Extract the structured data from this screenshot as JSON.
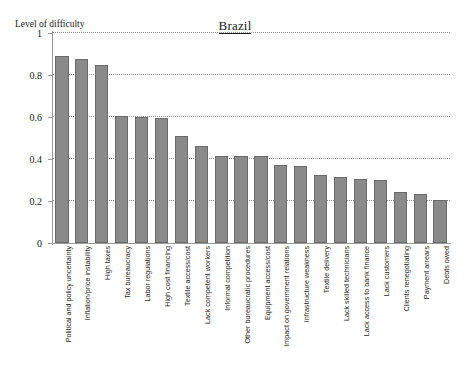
{
  "chart_data": {
    "type": "bar",
    "title": "Brazil",
    "xlabel": "",
    "ylabel": "Level of difficulty",
    "ylim": [
      0,
      1
    ],
    "yticks": [
      "0",
      "0.2",
      "0.4",
      "0.6",
      "0.8",
      "1"
    ],
    "ytick_values": [
      0,
      0.2,
      0.4,
      0.6,
      0.8,
      1
    ],
    "grid": true,
    "grid_style": "dotted-horizontal",
    "legend": "none",
    "bar_color": "#8a8a8a",
    "bar_edge_color": "#6a6a6a",
    "categories": [
      "Political and policy uncertainty",
      "Inflation/price instability",
      "High taxes",
      "Tax bureaucracy",
      "Labor regulations",
      "High cost financing",
      "Textile access/cost",
      "Lack competent workers",
      "Informal competition",
      "Other bureaucratic procedures",
      "Equipment access/cost",
      "Impact on government relations",
      "Infrastructure weakness",
      "Textile delivery",
      "Lack skilled technicians",
      "Lack access to bank finance",
      "Lack customers",
      "Clients renegotiating",
      "Payment arrears",
      "Debts owed"
    ],
    "values": [
      0.89,
      0.875,
      0.85,
      0.605,
      0.6,
      0.595,
      0.51,
      0.46,
      0.415,
      0.415,
      0.415,
      0.37,
      0.365,
      0.325,
      0.315,
      0.305,
      0.3,
      0.245,
      0.235,
      0.205
    ]
  }
}
